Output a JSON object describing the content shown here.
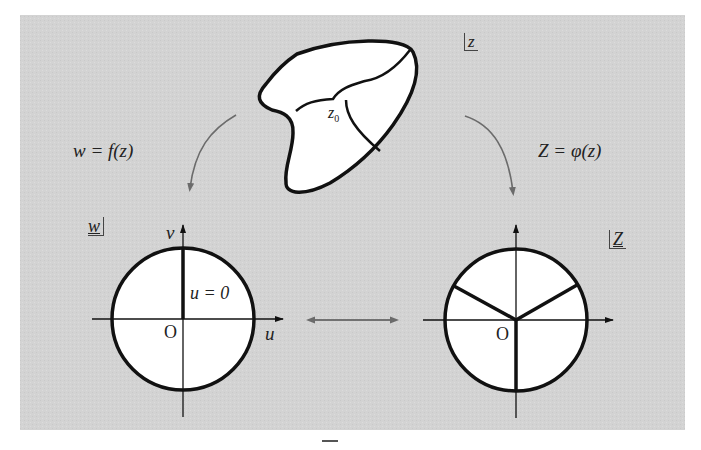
{
  "figure": {
    "colors": {
      "panel_background": "#d4d4d4",
      "region_fill": "#ffffff",
      "stroke": "#111111",
      "arrow": "#707070"
    },
    "z_plane": {
      "plane_label": "z",
      "point_label": "z",
      "point_subscript": "0"
    },
    "left_map": {
      "label": "w = f(z)"
    },
    "right_map": {
      "label": "Z = φ(z)"
    },
    "w_plane": {
      "plane_label": "w",
      "vertical_axis": "v",
      "horizontal_axis": "u",
      "origin": "O",
      "line_label": "u = 0"
    },
    "Z_plane": {
      "plane_label": "Z",
      "origin": "O"
    },
    "middle_arrow": "double-headed arrow between w-plane and Z-plane"
  }
}
